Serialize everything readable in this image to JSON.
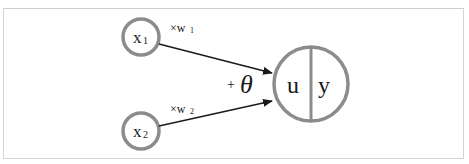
{
  "diagram": {
    "inputs": [
      {
        "id": "x1",
        "label": "x",
        "sub": "1",
        "weight_label": "×w",
        "weight_sub": "1"
      },
      {
        "id": "x2",
        "label": "x",
        "sub": "2",
        "weight_label": "×w",
        "weight_sub": "2"
      }
    ],
    "bias_label": "+",
    "bias_symbol": "θ",
    "neuron": {
      "left_label": "u",
      "right_label": "y"
    },
    "colors": {
      "circle_stroke": "#8c8c8c",
      "arrow": "#1a1a1a",
      "frame": "#d4d4d4",
      "text": "#1a1a1a"
    }
  }
}
